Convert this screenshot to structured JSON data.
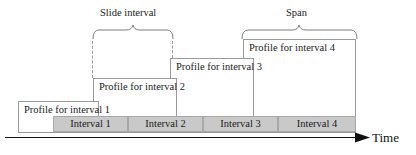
{
  "figure": {
    "type": "diagram",
    "colors": {
      "interval_fill": "#c9c9c9",
      "interval_stroke": "#a8a8a8",
      "box_fill": "#ffffff",
      "box_stroke": "#9a9a9a",
      "text": "#1a1a1a",
      "background": "#ffffff"
    }
  },
  "annotations": {
    "slide_interval": {
      "label": "Slide interval",
      "brace_x_start": 92,
      "brace_x_end": 172
    },
    "span": {
      "label": "Span",
      "brace_x_start": 241,
      "brace_x_end": 356
    }
  },
  "profiles": [
    {
      "label": "Profile for interval 1",
      "x": 18,
      "y": 101,
      "width": 81,
      "height": 32
    },
    {
      "label": "Profile for interval 2",
      "x": 93,
      "y": 78,
      "width": 84,
      "height": 55
    },
    {
      "label": "Profile for interval 3",
      "x": 170,
      "y": 58,
      "width": 84,
      "height": 75
    },
    {
      "label": "Profile for interval 4",
      "x": 243,
      "y": 39,
      "width": 113,
      "height": 94
    }
  ],
  "intervals": [
    {
      "label": "Interval 1",
      "x": 53,
      "width": 75
    },
    {
      "label": "Interval 2",
      "x": 128,
      "width": 75
    },
    {
      "label": "Interval 3",
      "x": 203,
      "width": 75
    },
    {
      "label": "Interval 4",
      "x": 278,
      "width": 78
    }
  ],
  "dashed_guides": [
    {
      "x": 92,
      "y_top": 41,
      "y_bottom": 78
    },
    {
      "x": 172,
      "y_top": 41,
      "y_bottom": 58
    }
  ],
  "axis": {
    "label": "Time",
    "line_x_start": 5,
    "line_x_end": 368,
    "line_y": 137,
    "arrow": "right-arrow"
  }
}
